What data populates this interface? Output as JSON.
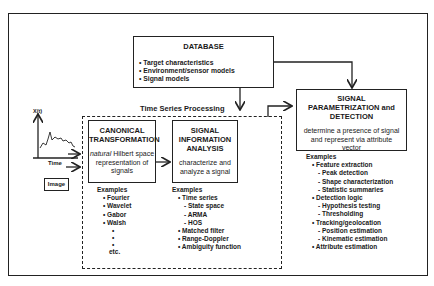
{
  "database": {
    "title": "DATABASE",
    "items": [
      "• Target characteristics",
      "• Environment/sensor models",
      "• Signal models"
    ]
  },
  "time_series_label": "Time Series Processing",
  "input": {
    "y_axis_label": "X(t)",
    "x_axis_label": "Time",
    "image_label": "Image"
  },
  "canonical": {
    "title_line1": "CANONICAL",
    "title_line2": "TRANSFORMATION",
    "desc_italic": "natural",
    "desc_line1_rest": " Hilbert space",
    "desc_line2": "representation of",
    "desc_line3": "signals",
    "examples_header": "Examples",
    "examples": [
      "• Fourier",
      "• Wavelet",
      "• Gabor",
      "• Walsh",
      "•",
      "•",
      "•",
      "etc."
    ]
  },
  "analysis": {
    "title_line1": "SIGNAL",
    "title_line2": "INFORMATION",
    "title_line3": "ANALYSIS",
    "desc_line1": "characterize and",
    "desc_line2": "analyze a signal",
    "examples_header": "Examples",
    "examples": [
      {
        "text": "• Time series",
        "level": 1
      },
      {
        "text": "- State space",
        "level": 2
      },
      {
        "text": "- ARMA",
        "level": 2
      },
      {
        "text": "- HOS",
        "level": 2
      },
      {
        "text": "• Matched filter",
        "level": 1
      },
      {
        "text": "• Range-Doppler",
        "level": 1
      },
      {
        "text": "• Ambiguity function",
        "level": 1
      }
    ]
  },
  "detection": {
    "title_line1": "SIGNAL",
    "title_line2": "PARAMETRIZATION and",
    "title_line3": "DETECTION",
    "desc_line1": "determine a presence of signal",
    "desc_line2": "and represent via attribute",
    "desc_line3": "vector",
    "examples_header": "Examples",
    "examples": [
      {
        "text": "• Feature extraction",
        "level": 1
      },
      {
        "text": "- Peak detection",
        "level": 2
      },
      {
        "text": "- Shape characterization",
        "level": 2
      },
      {
        "text": "- Statistic summaries",
        "level": 2
      },
      {
        "text": "• Detection logic",
        "level": 1
      },
      {
        "text": "- Hypothesis testing",
        "level": 2
      },
      {
        "text": "- Thresholding",
        "level": 2
      },
      {
        "text": "• Tracking/geolocation",
        "level": 1
      },
      {
        "text": "- Position estimation",
        "level": 2
      },
      {
        "text": "- Kinematic estimation",
        "level": 2
      },
      {
        "text": "• Attribute estimation",
        "level": 1
      }
    ]
  }
}
